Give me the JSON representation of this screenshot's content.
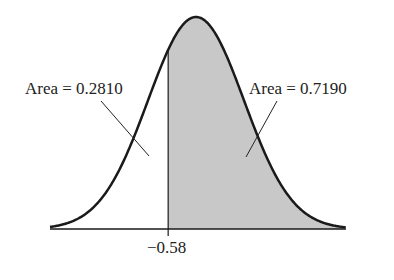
{
  "chart_data": {
    "type": "area",
    "title": "",
    "distribution": "standard normal",
    "cutoff": -0.58,
    "cutoff_label": "−0.58",
    "regions": [
      {
        "name": "left",
        "range": [
          null,
          -0.58
        ],
        "area": 0.281,
        "shaded": false,
        "label": "Area = 0.2810"
      },
      {
        "name": "right",
        "range": [
          -0.58,
          null
        ],
        "area": 0.719,
        "shaded": true,
        "label": "Area = 0.7190"
      }
    ],
    "xlabel": "",
    "ylabel": "",
    "grid": false,
    "colors": {
      "curve": "#1a1a1a",
      "shade": "#c8c8c8",
      "axis": "#1a1a1a"
    }
  },
  "labels": {
    "left_area": "Area = 0.2810",
    "right_area": "Area = 0.7190",
    "cutoff": "−0.58"
  }
}
